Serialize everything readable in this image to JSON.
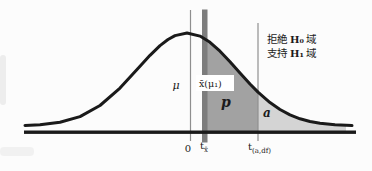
{
  "colors": {
    "curve": "#1a1a1a",
    "axis": "#1a1a1a",
    "p_region": "#a2a2a2",
    "alpha_region": "#d4d4d4",
    "marker_bar": "#7d7d7d",
    "guide_line": "#8f8f8f",
    "label_box": "#ffffff"
  },
  "labels": {
    "mu": "μ",
    "xbar": "x̄(μ₁)",
    "p": "p",
    "alpha": "a"
  },
  "axis": {
    "zero": "0",
    "t_xbar_base": "t",
    "t_xbar_sub": "x̄",
    "t_crit_base": "t",
    "t_crit_sub": "(a,df)"
  },
  "annotation": {
    "line1_action": "拒絶",
    "line1_h": "H₀",
    "line1_region": "域",
    "line2_action": "支持",
    "line2_h": "H₁",
    "line2_region": "域"
  }
}
